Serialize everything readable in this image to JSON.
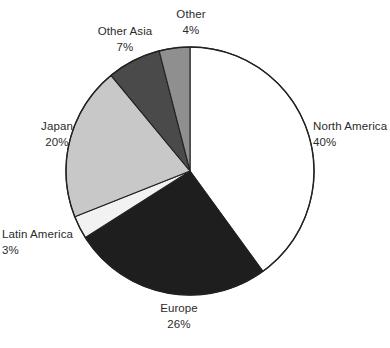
{
  "chart_data": {
    "type": "pie",
    "title": "",
    "subtitle": "",
    "xlabel": "",
    "ylabel": "",
    "legend_position": "none",
    "grid": false,
    "units": "percent",
    "start_angle_deg": 0,
    "direction": "clockwise",
    "categories": [
      "North America",
      "Europe",
      "Latin America",
      "Japan",
      "Other Asia",
      "Other"
    ],
    "values": [
      40,
      26,
      3,
      20,
      7,
      4
    ],
    "value_labels": [
      "40%",
      "26%",
      "3%",
      "20%",
      "7%",
      "4%"
    ],
    "colors": [
      "#ffffff",
      "#1e1e1e",
      "#f2f2f2",
      "#c8c8c8",
      "#4a4a4a",
      "#8f8f8f"
    ],
    "outline_color": "#222222",
    "slices": [
      {
        "name": "North America",
        "value": 40,
        "value_label": "40%",
        "color": "#ffffff",
        "start_deg": 0,
        "end_deg": 144
      },
      {
        "name": "Europe",
        "value": 26,
        "value_label": "26%",
        "color": "#1e1e1e",
        "start_deg": 144,
        "end_deg": 237.6
      },
      {
        "name": "Latin America",
        "value": 3,
        "value_label": "3%",
        "color": "#f2f2f2",
        "start_deg": 237.6,
        "end_deg": 248.4
      },
      {
        "name": "Japan",
        "value": 20,
        "value_label": "20%",
        "color": "#c8c8c8",
        "start_deg": 248.4,
        "end_deg": 320.4
      },
      {
        "name": "Other Asia",
        "value": 7,
        "value_label": "7%",
        "color": "#4a4a4a",
        "start_deg": 320.4,
        "end_deg": 345.6
      },
      {
        "name": "Other",
        "value": 4,
        "value_label": "4%",
        "color": "#8f8f8f",
        "start_deg": 345.6,
        "end_deg": 360
      }
    ]
  }
}
